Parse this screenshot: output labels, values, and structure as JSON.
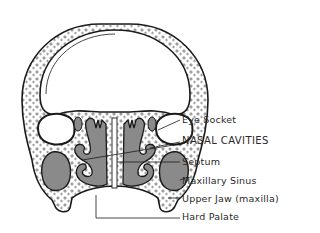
{
  "figure": {
    "colors": {
      "bone_outline": "#1a1a1a",
      "cavity_fill": "#8a8a8a",
      "background": "#ffffff"
    },
    "labels": [
      {
        "id": "eye-socket",
        "text": "Eye Socket"
      },
      {
        "id": "nasal-cavities",
        "text": "NASAL CAVITIES"
      },
      {
        "id": "septum",
        "text": "Septum"
      },
      {
        "id": "maxillary-sinus",
        "text": "Maxillary Sinus"
      },
      {
        "id": "upper-jaw",
        "text": "Upper Jaw (maxilla)"
      },
      {
        "id": "hard-palate",
        "text": "Hard Palate"
      }
    ]
  }
}
